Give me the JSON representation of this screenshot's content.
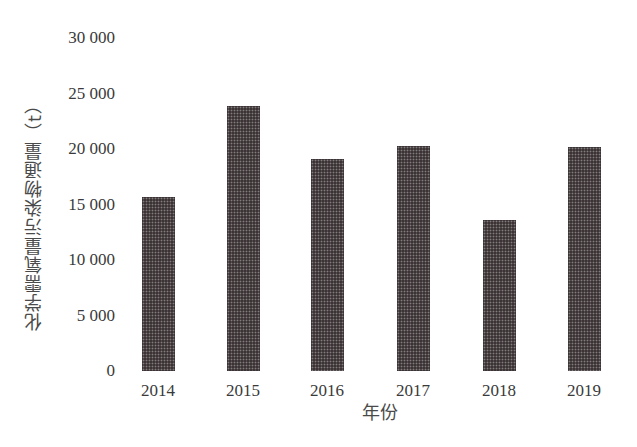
{
  "chart_data": {
    "type": "bar",
    "title": "",
    "xlabel": "年份",
    "ylabel": "化学需氧量污染物通量（t）",
    "categories": [
      "2014",
      "2015",
      "2016",
      "2017",
      "2018",
      "2019"
    ],
    "values": [
      15700,
      23900,
      19100,
      20300,
      13600,
      20200
    ],
    "ylim": [
      0,
      30000
    ],
    "yticks": [
      0,
      5000,
      10000,
      15000,
      20000,
      25000,
      30000
    ],
    "ytick_labels": [
      "0",
      "5 000",
      "10 000",
      "15 000",
      "20 000",
      "25 000",
      "30 000"
    ],
    "grid": false,
    "legend": null,
    "bar_color": "#3b3335"
  }
}
